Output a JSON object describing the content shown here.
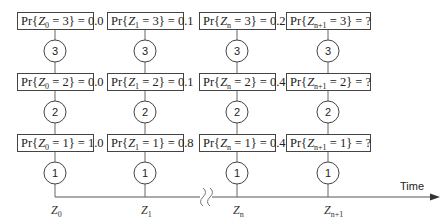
{
  "diagram": {
    "axis_label": "Time",
    "columns": [
      {
        "var": "Z",
        "sub": "0",
        "x": 55,
        "rows": [
          {
            "state": "3",
            "eq": "3",
            "value": "0.0"
          },
          {
            "state": "2",
            "eq": "2",
            "value": "0.0"
          },
          {
            "state": "1",
            "eq": "1",
            "value": "1.0"
          }
        ]
      },
      {
        "var": "Z",
        "sub": "1",
        "x": 145,
        "rows": [
          {
            "state": "3",
            "eq": "3",
            "value": "0.1"
          },
          {
            "state": "2",
            "eq": "2",
            "value": "0.1"
          },
          {
            "state": "1",
            "eq": "1",
            "value": "0.8"
          }
        ]
      },
      {
        "var": "Z",
        "sub": "n",
        "x": 237,
        "rows": [
          {
            "state": "3",
            "eq": "3",
            "value": "0.2"
          },
          {
            "state": "2",
            "eq": "2",
            "value": "0.4"
          },
          {
            "state": "1",
            "eq": "1",
            "value": "0.4"
          }
        ]
      },
      {
        "var": "Z",
        "sub": "n+1",
        "x": 328,
        "rows": [
          {
            "state": "3",
            "eq": "3",
            "value": "?"
          },
          {
            "state": "2",
            "eq": "2",
            "value": "?"
          },
          {
            "state": "1",
            "eq": "1",
            "value": "?"
          }
        ]
      }
    ],
    "labels": {
      "pr": "Pr{",
      "eq_sign": " = ",
      "close": "} = "
    }
  }
}
